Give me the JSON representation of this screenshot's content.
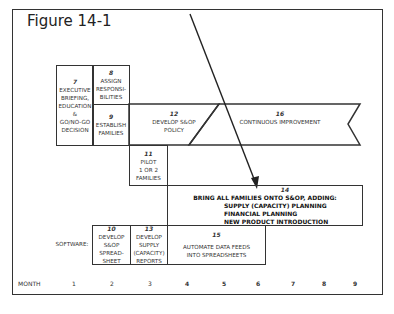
{
  "figure": {
    "title": "Figure 14-1"
  },
  "tasks": {
    "t7": {
      "num": "7",
      "lines": [
        "EXECUTIVE",
        "BRIEFING,",
        "EDUCATION",
        "&",
        "GO/NO-GO",
        "DECISION"
      ]
    },
    "t8": {
      "num": "8",
      "lines": [
        "ASSIGN",
        "RESPONSI-",
        "BILITIES"
      ]
    },
    "t9": {
      "num": "9",
      "lines": [
        "ESTABLISH",
        "FAMILIES"
      ]
    },
    "t12": {
      "num": "12",
      "lines": [
        "DEVELOP  S&OP",
        "POLICY"
      ]
    },
    "t16": {
      "num": "16",
      "lines": [
        "CONTINUOUS IMPROVEMENT"
      ]
    },
    "t11": {
      "num": "11",
      "lines": [
        "PILOT",
        "1 OR 2",
        "FAMILIES"
      ]
    },
    "t14": {
      "num": "14",
      "lines": [
        "BRING ALL FAMILIES ONTO S&OP, ADDING:",
        "SUPPLY (CAPACITY) PLANNING",
        "FINANCIAL PLANNING",
        "NEW PRODUCT INTRODUCTION"
      ]
    },
    "t10": {
      "num": "10",
      "lines": [
        "DEVELOP",
        "S&OP",
        "SPREAD-",
        "SHEET"
      ]
    },
    "t13": {
      "num": "13",
      "lines": [
        "DEVELOP",
        "SUPPLY",
        "(CAPACITY)",
        "REPORTS"
      ]
    },
    "t15": {
      "num": "15",
      "lines": [
        "AUTOMATE DATA FEEDS",
        "INTO SPREADSHEETS"
      ]
    }
  },
  "software_label": "SOFTWARE:",
  "timeline": {
    "label": "MONTH",
    "months": [
      "1",
      "2",
      "3",
      "4",
      "5",
      "6",
      "7",
      "8",
      "9"
    ]
  },
  "colors": {
    "line": "#333333",
    "background": "#ffffff"
  }
}
